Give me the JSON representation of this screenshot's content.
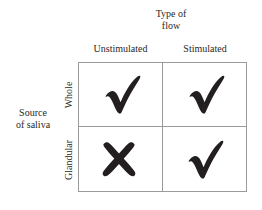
{
  "figure": {
    "type": "2x2-matrix",
    "column_group_title": {
      "line1": "Type of",
      "line2": "flow"
    },
    "row_group_title": {
      "line1": "Source",
      "line2": "of saliva"
    },
    "column_headers": [
      "Unstimulated",
      "Stimulated"
    ],
    "row_headers": [
      "Whole",
      "Glandular"
    ],
    "cells": [
      {
        "row": "Whole",
        "column": "Unstimulated",
        "mark": "check",
        "mark_glyph": "✔"
      },
      {
        "row": "Whole",
        "column": "Stimulated",
        "mark": "check",
        "mark_glyph": "✔"
      },
      {
        "row": "Glandular",
        "column": "Unstimulated",
        "mark": "cross",
        "mark_glyph": "✘"
      },
      {
        "row": "Glandular",
        "column": "Stimulated",
        "mark": "check",
        "mark_glyph": "✔"
      }
    ],
    "colors": {
      "mark": "#231f20",
      "grid_line": "#9a9a9a",
      "text": "#2b2724",
      "background": "#ffffff"
    },
    "caption_remnant": ""
  }
}
